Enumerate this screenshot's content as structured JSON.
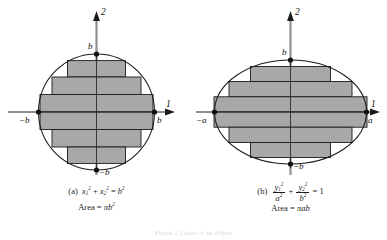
{
  "figure": {
    "bottom_partial_caption": "Figure 2.1   Area of an ellipse"
  },
  "panels": [
    {
      "id": "a",
      "tag": "(a)",
      "equation_plain": "x₁² + x₂² = b²",
      "equation_parts": {
        "var": "x",
        "sub1": "1",
        "sub2": "2",
        "exp": "2",
        "rhs_var": "b",
        "rhs_exp": "2",
        "plus": "+",
        "equals": "="
      },
      "area_label": "Area",
      "area_equals": "=",
      "area_value_pi": "π",
      "area_value_var": "b",
      "area_value_exp": "2",
      "axes": {
        "horizontal_label": "1",
        "vertical_label": "2",
        "right_tick": "b",
        "left_tick": "−b",
        "top_tick": "b",
        "bottom_tick": "−b"
      },
      "shape": "circle",
      "radius_x_px": 58,
      "radius_y_px": 58
    },
    {
      "id": "b",
      "tag": "(b)",
      "equation_plain": "y₁²/a² + y₂²/b² = 1",
      "equation_parts": {
        "var": "y",
        "sub1": "1",
        "sub2": "2",
        "exp": "2",
        "den1": "a",
        "den2": "b",
        "den_exp": "2",
        "plus": "+",
        "equals": "=",
        "rhs": "1"
      },
      "area_label": "Area",
      "area_equals": "=",
      "area_value_pi": "π",
      "area_value_a": "a",
      "area_value_b": "b",
      "axes": {
        "horizontal_label": "1",
        "vertical_label": "2",
        "right_tick": "a",
        "left_tick": "−a",
        "top_tick": "b",
        "bottom_tick": "−b"
      },
      "shape": "ellipse",
      "radius_x_px": 76,
      "radius_y_px": 52
    }
  ],
  "style": {
    "fill_gray": "#a8a8a8",
    "stroke_dark": "#111111",
    "axis_gray": "#8a8a8a",
    "background": "#ffffff"
  },
  "bars": {
    "count": 6,
    "description": "six inscribed horizontal rectangles, symmetric about the horizontal axis"
  }
}
